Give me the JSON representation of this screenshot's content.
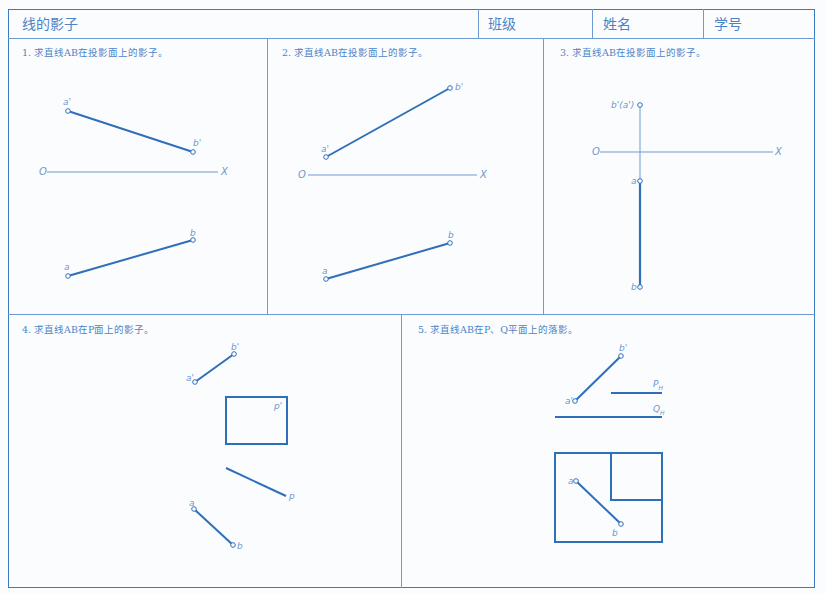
{
  "header": {
    "title": "线的影子",
    "class_label": "班级",
    "name_label": "姓名",
    "id_label": "学号"
  },
  "colors": {
    "line_blue": "#2f6fba",
    "frame_blue": "#3b7bc4",
    "text_blue": "#4a84c8",
    "label_blue": "#6c98cf"
  },
  "problems": [
    {
      "title": "1. 求直线AB在投影面上的影子。",
      "labels": {
        "a_prime": "a'",
        "b_prime": "b'",
        "o": "O",
        "x": "X",
        "a": "a",
        "b": "b"
      }
    },
    {
      "title": "2. 求直线AB在投影面上的影子。",
      "labels": {
        "a_prime": "a'",
        "b_prime": "b'",
        "o": "O",
        "x": "X",
        "a": "a",
        "b": "b"
      }
    },
    {
      "title": "3. 求直线AB在投影面上的影子。",
      "labels": {
        "b_prime_a_prime": "b'(a')",
        "o": "O",
        "x": "X",
        "a": "a",
        "b": "b"
      }
    },
    {
      "title": "4. 求直线AB在P面上的影子。",
      "labels": {
        "a_prime": "a'",
        "b_prime": "b'",
        "p_prime": "p'",
        "p": "p",
        "a": "a",
        "b": "b"
      }
    },
    {
      "title": "5. 求直线AB在P、Q平面上的落影。",
      "labels": {
        "a_prime": "a'",
        "b_prime": "b'",
        "p_h": "P",
        "p_h_sub": "H",
        "q_h": "Q",
        "q_h_sub": "H",
        "a": "a",
        "b": "b"
      }
    }
  ]
}
